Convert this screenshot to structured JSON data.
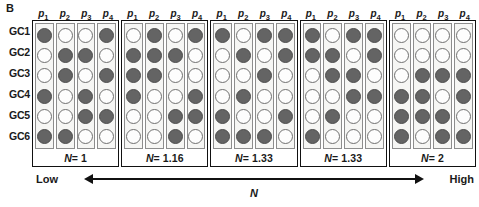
{
  "figure": {
    "panel_letter": "B",
    "row_labels": [
      "GC1",
      "GC2",
      "GC3",
      "GC4",
      "GC5",
      "GC6"
    ],
    "column_headers": [
      "p1",
      "p2",
      "p3",
      "p4"
    ],
    "column_header_parts": [
      {
        "base": "p",
        "sub": "1"
      },
      {
        "base": "p",
        "sub": "2"
      },
      {
        "base": "p",
        "sub": "3"
      },
      {
        "base": "p",
        "sub": "4"
      }
    ],
    "axis": {
      "low_label": "Low",
      "high_label": "High",
      "axis_title": "N",
      "arrow": "double-headed-arrow"
    }
  },
  "chart_data": {
    "type": "heatmap",
    "title": "B",
    "xlabel": "N",
    "ylabel": "",
    "legend": {
      "filled": "allele present (filled circle)",
      "empty": "allele absent (open circle)"
    },
    "rows": [
      "GC1",
      "GC2",
      "GC3",
      "GC4",
      "GC5",
      "GC6"
    ],
    "columns": [
      "p1",
      "p2",
      "p3",
      "p4"
    ],
    "encoding": "1 = filled (dark grey), 0 = empty (white)",
    "panels": [
      {
        "n_label": "N = 1",
        "n_value": 1,
        "matrix": [
          [
            1,
            0,
            0,
            1
          ],
          [
            0,
            1,
            1,
            0
          ],
          [
            0,
            1,
            0,
            1
          ],
          [
            1,
            0,
            1,
            0
          ],
          [
            0,
            0,
            1,
            1
          ],
          [
            1,
            1,
            0,
            0
          ]
        ]
      },
      {
        "n_label": "N = 1.16",
        "n_value": 1.16,
        "matrix": [
          [
            0,
            1,
            0,
            1
          ],
          [
            1,
            1,
            1,
            0
          ],
          [
            1,
            1,
            0,
            0
          ],
          [
            1,
            0,
            0,
            1
          ],
          [
            0,
            0,
            1,
            1
          ],
          [
            0,
            0,
            1,
            0
          ]
        ]
      },
      {
        "n_label": "N = 1.33",
        "n_value": 1.33,
        "matrix": [
          [
            1,
            0,
            1,
            1
          ],
          [
            0,
            1,
            0,
            1
          ],
          [
            0,
            0,
            1,
            0
          ],
          [
            0,
            1,
            0,
            0
          ],
          [
            1,
            0,
            0,
            1
          ],
          [
            1,
            1,
            1,
            0
          ]
        ]
      },
      {
        "n_label": "N = 1.33",
        "n_value": 1.33,
        "matrix": [
          [
            1,
            0,
            1,
            1
          ],
          [
            1,
            1,
            0,
            1
          ],
          [
            0,
            1,
            1,
            0
          ],
          [
            0,
            0,
            1,
            1
          ],
          [
            0,
            1,
            0,
            0
          ],
          [
            1,
            0,
            0,
            0
          ]
        ]
      },
      {
        "n_label": "N = 2",
        "n_value": 2,
        "matrix": [
          [
            0,
            0,
            0,
            0
          ],
          [
            0,
            0,
            0,
            0
          ],
          [
            0,
            1,
            1,
            1
          ],
          [
            1,
            1,
            0,
            1
          ],
          [
            1,
            1,
            1,
            0
          ],
          [
            1,
            0,
            1,
            1
          ]
        ]
      }
    ]
  }
}
